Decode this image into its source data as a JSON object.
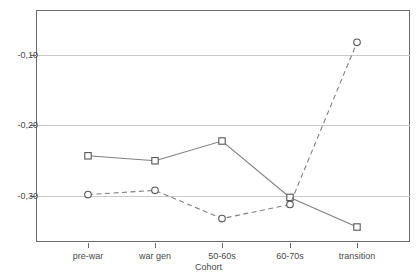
{
  "chart_data": {
    "type": "line",
    "title": "",
    "xlabel": "Cohort",
    "ylabel": "",
    "categories": [
      "pre-war",
      "war gen",
      "50-60s",
      "60-70s",
      "transition"
    ],
    "series": [
      {
        "name": "solid-square-series",
        "marker": "square",
        "linestyle": "solid",
        "color": "#808080",
        "values": [
          -0.243,
          -0.25,
          -0.222,
          -0.302,
          -0.344
        ]
      },
      {
        "name": "dashed-circle-series",
        "marker": "circle",
        "linestyle": "dashed",
        "color": "#808080",
        "values": [
          -0.298,
          -0.292,
          -0.332,
          -0.312,
          -0.082
        ]
      }
    ],
    "ytick_labels": [
      "-0,10",
      "-0,20",
      "-0,30"
    ],
    "ytick_values": [
      -0.1,
      -0.2,
      -0.3
    ],
    "ylim": [
      -0.3675,
      -0.0345
    ],
    "grid": true,
    "legend": "none"
  },
  "axes": {
    "x_axis_title": "Cohort",
    "y_axis_title": ""
  },
  "title_remnant": {
    "text": ""
  }
}
